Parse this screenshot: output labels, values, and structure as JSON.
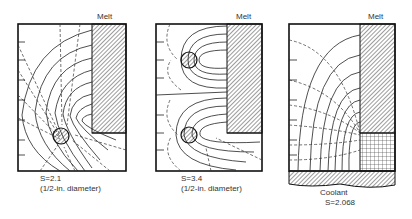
{
  "figure": {
    "panels": [
      {
        "melt_label": "Melt",
        "shape_factor": "S=2.1",
        "caption": "(1/2-in. diameter)",
        "configuration": "single cooling pipe"
      },
      {
        "melt_label": "Melt",
        "shape_factor": "S=3.4",
        "caption": "(1/2-in. diameter)",
        "configuration": "two cooling pipes"
      },
      {
        "melt_label": "Melt",
        "coolant_label": "Coolant",
        "shape_factor": "S=2.068",
        "configuration": "coolant-plate bottom"
      }
    ]
  }
}
